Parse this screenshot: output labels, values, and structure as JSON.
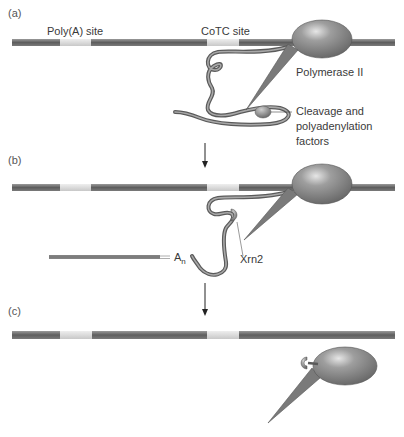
{
  "panels": {
    "a": {
      "label": "(a)"
    },
    "b": {
      "label": "(b)"
    },
    "c": {
      "label": "(c)"
    }
  },
  "labels": {
    "polya_site": "Poly(A) site",
    "cotc_site": "CoTC site",
    "polymerase": "Polymerase II",
    "cleavage_line1": "Cleavage and",
    "cleavage_line2": "polyadenylation",
    "cleavage_line3": "factors",
    "xrn2": "Xrn2",
    "an_base": "A",
    "an_sub": "n"
  },
  "colors": {
    "dna": "#6e6e6e",
    "site": "#d8d8d8",
    "polymerase": "#8a8a8a",
    "rna": "#7a7a7a",
    "text": "#3a3a3a"
  }
}
